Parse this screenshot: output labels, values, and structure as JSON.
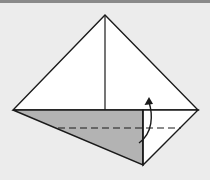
{
  "diagram": {
    "type": "origami-fold-step",
    "colors": {
      "background": "#ececec",
      "top_bar": "#8a8a8a",
      "paper": "#ffffff",
      "shaded": "#b3b3b3",
      "stroke": "#1a1a1a"
    },
    "points": {
      "apex": [
        105,
        15
      ],
      "left": [
        13,
        110
      ],
      "right": [
        198,
        110
      ],
      "bottom": [
        143,
        165
      ],
      "center_base": [
        105,
        110
      ],
      "fold_base": [
        143,
        110
      ]
    },
    "dashed_fold_line": {
      "y": 128,
      "x1": 58,
      "x2": 181
    },
    "arrow": {
      "direction": "up",
      "label": "fold-up-arrow"
    }
  }
}
